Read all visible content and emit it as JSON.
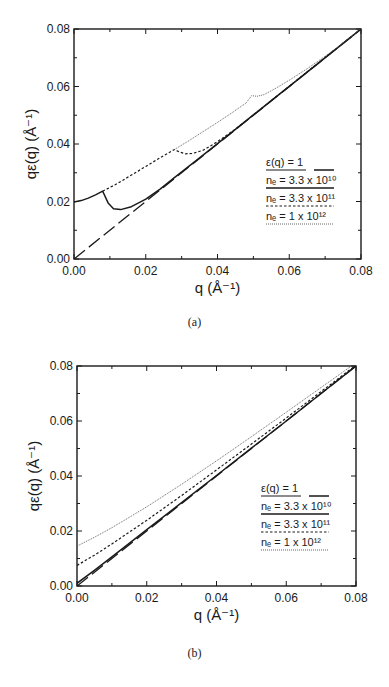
{
  "figure": {
    "panels": [
      {
        "id": "a",
        "caption": "(a)"
      },
      {
        "id": "b",
        "caption": "(b)"
      }
    ]
  },
  "axes": {
    "xlabel": "q (Å⁻¹)",
    "ylabel": "qε(q) (Å⁻¹)",
    "xticks": [
      "0.00",
      "0.02",
      "0.04",
      "0.06",
      "0.08"
    ],
    "yticks": [
      "0.00",
      "0.02",
      "0.04",
      "0.06",
      "0.08"
    ]
  },
  "legend": [
    {
      "label": "ε(q) = 1",
      "style": "long-dash"
    },
    {
      "label": "nₑ = 3.3 x 10¹⁰",
      "style": "solid"
    },
    {
      "label": "nₑ = 3.3 x 10¹¹",
      "style": "short-dash"
    },
    {
      "label": "nₑ = 1 x 10¹²",
      "style": "dotted"
    }
  ],
  "chart_data": [
    {
      "type": "line",
      "title": "(a)",
      "xlabel": "q (Å⁻¹)",
      "ylabel": "qε(q) (Å⁻¹)",
      "xlim": [
        0,
        0.08
      ],
      "ylim": [
        0,
        0.08
      ],
      "xticks": [
        0,
        0.02,
        0.04,
        0.06,
        0.08
      ],
      "yticks": [
        0,
        0.02,
        0.04,
        0.06,
        0.08
      ],
      "minor_ticks": true,
      "grid": false,
      "legend_position": "lower right",
      "series": [
        {
          "name": "ε(q) = 1",
          "style": "long-dash",
          "x": [
            0,
            0.08
          ],
          "y": [
            0,
            0.08
          ]
        },
        {
          "name": "nₑ = 3.3 x 10¹⁰",
          "style": "solid",
          "x": [
            0,
            0.002,
            0.004,
            0.006,
            0.008,
            0.0095,
            0.011,
            0.013,
            0.016,
            0.02,
            0.024,
            0.028,
            0.035,
            0.045,
            0.055,
            0.065,
            0.08
          ],
          "y": [
            0.0198,
            0.0203,
            0.0212,
            0.0223,
            0.0236,
            0.0195,
            0.0175,
            0.0172,
            0.0182,
            0.0208,
            0.0243,
            0.0283,
            0.0352,
            0.0451,
            0.0551,
            0.065,
            0.08
          ]
        },
        {
          "name": "nₑ = 3.3 x 10¹¹",
          "style": "short-dash",
          "x": [
            0.008,
            0.012,
            0.016,
            0.02,
            0.024,
            0.028,
            0.0295,
            0.031,
            0.033,
            0.036,
            0.04,
            0.045,
            0.05,
            0.055,
            0.06,
            0.07,
            0.08
          ],
          "y": [
            0.0236,
            0.0262,
            0.0292,
            0.0322,
            0.0352,
            0.0381,
            0.0372,
            0.0366,
            0.0367,
            0.0378,
            0.0408,
            0.0452,
            0.0501,
            0.0551,
            0.0601,
            0.0701,
            0.08
          ]
        },
        {
          "name": "nₑ = 1 x 10¹²",
          "style": "dotted",
          "x": [
            0.028,
            0.032,
            0.036,
            0.04,
            0.044,
            0.048,
            0.0495,
            0.051,
            0.053,
            0.056,
            0.06,
            0.065,
            0.07,
            0.075,
            0.08
          ],
          "y": [
            0.0381,
            0.0411,
            0.0443,
            0.0475,
            0.0508,
            0.0543,
            0.0568,
            0.0566,
            0.0572,
            0.0592,
            0.0622,
            0.0662,
            0.0705,
            0.0751,
            0.0802
          ]
        }
      ]
    },
    {
      "type": "line",
      "title": "(b)",
      "xlabel": "q (Å⁻¹)",
      "ylabel": "qε(q) (Å⁻¹)",
      "xlim": [
        0,
        0.08
      ],
      "ylim": [
        0,
        0.08
      ],
      "xticks": [
        0,
        0.02,
        0.04,
        0.06,
        0.08
      ],
      "yticks": [
        0,
        0.02,
        0.04,
        0.06,
        0.08
      ],
      "minor_ticks": true,
      "grid": false,
      "legend_position": "lower right",
      "series": [
        {
          "name": "ε(q) = 1",
          "style": "long-dash",
          "x": [
            0,
            0.08
          ],
          "y": [
            0,
            0.08
          ]
        },
        {
          "name": "nₑ = 3.3 x 10¹⁰",
          "style": "solid",
          "x": [
            0,
            0.005,
            0.01,
            0.02,
            0.03,
            0.04,
            0.05,
            0.06,
            0.07,
            0.08
          ],
          "y": [
            0.001,
            0.0057,
            0.0106,
            0.0205,
            0.0303,
            0.0402,
            0.0501,
            0.06,
            0.07,
            0.08
          ]
        },
        {
          "name": "nₑ = 3.3 x 10¹¹",
          "style": "short-dash",
          "x": [
            0,
            0.005,
            0.01,
            0.02,
            0.03,
            0.04,
            0.05,
            0.06,
            0.07,
            0.08
          ],
          "y": [
            0.0075,
            0.0112,
            0.0153,
            0.0239,
            0.0329,
            0.0422,
            0.0516,
            0.0611,
            0.0707,
            0.0803
          ]
        },
        {
          "name": "nₑ = 1 x 10¹²",
          "style": "dotted",
          "x": [
            0,
            0.005,
            0.01,
            0.02,
            0.03,
            0.04,
            0.05,
            0.06,
            0.07,
            0.08
          ],
          "y": [
            0.0145,
            0.0177,
            0.0212,
            0.0288,
            0.037,
            0.0455,
            0.0543,
            0.0632,
            0.0722,
            0.0812
          ]
        }
      ]
    }
  ]
}
